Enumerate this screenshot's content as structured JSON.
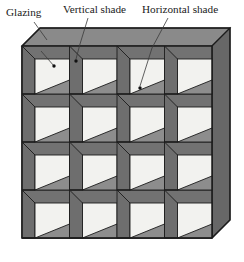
{
  "figure": {
    "projection": "axonometric",
    "grid": {
      "rows": 4,
      "columns": 4,
      "cell_count": 16
    },
    "background_color": "#ffffff"
  },
  "callouts": [
    {
      "id": "glazing",
      "label": "Glazing",
      "label_x": 6,
      "label_y": 16,
      "leader": {
        "x1": 34,
        "y1": 22,
        "x2": 47,
        "y2": 40
      },
      "pointer": {
        "x1": 41,
        "y1": 51,
        "x2": 54,
        "y2": 66
      },
      "dot": {
        "cx": 54,
        "cy": 66,
        "r": 1.7
      },
      "target": "glazing-panel-r1c1"
    },
    {
      "id": "vertical-shade",
      "label": "Vertical shade",
      "label_x": 63,
      "label_y": 13,
      "leader": {
        "x1": 88,
        "y1": 18,
        "x2": 80,
        "y2": 44
      },
      "pointer": {
        "x1": 80,
        "y1": 44,
        "x2": 76,
        "y2": 60
      },
      "dot": {
        "cx": 76,
        "cy": 61,
        "r": 1.7
      },
      "target": "vertical-shade-r1c2"
    },
    {
      "id": "horizontal-shade",
      "label": "Horizontal shade",
      "label_x": 142,
      "label_y": 13,
      "leader": {
        "x1": 168,
        "y1": 18,
        "x2": 152,
        "y2": 48
      },
      "pointer": {
        "x1": 152,
        "y1": 48,
        "x2": 140,
        "y2": 87
      },
      "dot": {
        "cx": 140,
        "cy": 88,
        "r": 1.7
      },
      "target": "horizontal-shade-r1c3"
    }
  ],
  "colors": {
    "glazing_fill": "#f2f2ef",
    "vertical_shade_fill": "#6e6e6e",
    "horizontal_shade_fill": "#8d8d8d",
    "top_face_fill": "#8a8a8a",
    "right_face_fill": "#676767",
    "frame_fill": "#727272",
    "outline": "#1c1c1c",
    "leader_line": "#3a3a3a",
    "dot_fill": "#111111",
    "label_text": "#1a1a1a"
  },
  "geometry": {
    "front_left": 22,
    "front_top": 46,
    "front_right": 212,
    "front_bottom": 238,
    "depth_dx": 18,
    "depth_dy": -18,
    "cell_width": 47.5,
    "cell_height": 48,
    "fin_width": 13,
    "shelf_height": 14
  },
  "parts": {
    "glazing_name": "Glazing",
    "vertical_shade_name": "Vertical shade",
    "horizontal_shade_name": "Horizontal shade"
  }
}
